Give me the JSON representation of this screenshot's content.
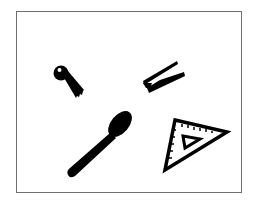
{
  "scene": {
    "background": "#ffffff",
    "frame_border_color": "#6e6e6e",
    "icon_color": "#000000",
    "objects": [
      {
        "id": "key",
        "label": "key"
      },
      {
        "id": "clothespin",
        "label": "clothespin"
      },
      {
        "id": "spoon",
        "label": "spoon"
      },
      {
        "id": "set-square",
        "label": "set square"
      }
    ]
  }
}
